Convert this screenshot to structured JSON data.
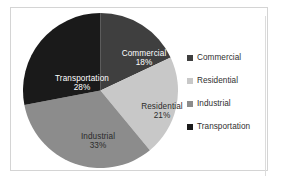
{
  "chart_data": {
    "type": "pie",
    "title": "",
    "categories": [
      "Commercial",
      "Residential",
      "Industrial",
      "Transportation"
    ],
    "values": [
      18,
      21,
      33,
      28
    ],
    "value_labels": [
      "18%",
      "21%",
      "33%",
      "28%"
    ],
    "units": "percent",
    "start_angle_deg": 0,
    "direction": "clockwise",
    "legend_position": "right",
    "grid": false,
    "colors": [
      "#3f3f3f",
      "#c8c8c8",
      "#8c8c8c",
      "#1a1a1a"
    ],
    "label_text_colors": [
      "#ffffff",
      "#2b2b2b",
      "#2b2b2b",
      "#ffffff"
    ],
    "slices": [
      {
        "name": "Commercial",
        "value": 18,
        "value_label": "18%",
        "color": "#3f3f3f",
        "label_color": "#ffffff"
      },
      {
        "name": "Residential",
        "value": 21,
        "value_label": "21%",
        "color": "#c8c8c8",
        "label_color": "#2b2b2b"
      },
      {
        "name": "Industrial",
        "value": 33,
        "value_label": "33%",
        "color": "#8c8c8c",
        "label_color": "#2b2b2b"
      },
      {
        "name": "Transportation",
        "value": 28,
        "value_label": "28%",
        "color": "#1a1a1a",
        "label_color": "#ffffff"
      }
    ]
  },
  "legend": {
    "items": [
      {
        "label": "Commercial",
        "color": "#3f3f3f"
      },
      {
        "label": "Residential",
        "color": "#c8c8c8"
      },
      {
        "label": "Industrial",
        "color": "#8c8c8c"
      },
      {
        "label": "Transportation",
        "color": "#1a1a1a"
      }
    ]
  }
}
